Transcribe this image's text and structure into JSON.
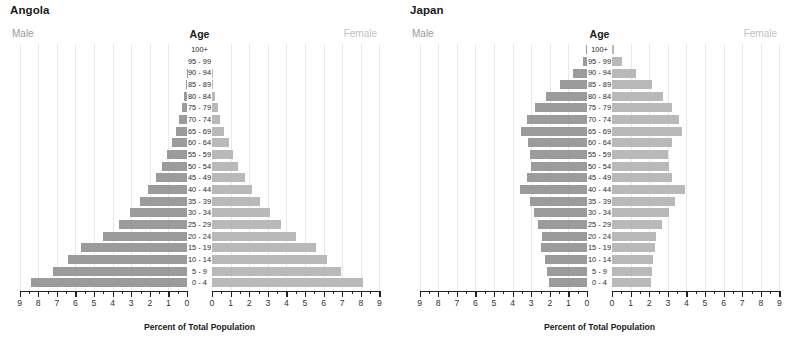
{
  "chart_data": {
    "type": "bar",
    "chart_style": "population-pyramid",
    "xlabel": "Percent of Total Population",
    "ylabel": "Age",
    "xlim": [
      0,
      9
    ],
    "xticks": [
      0,
      1,
      2,
      3,
      4,
      5,
      6,
      7,
      8,
      9
    ],
    "grid": true,
    "legend_position": "top-left-and-top-right",
    "categories": [
      "0 - 4",
      "5 - 9",
      "10 - 14",
      "15 - 19",
      "20 - 24",
      "25 - 29",
      "30 - 34",
      "35 - 39",
      "40 - 44",
      "45 - 49",
      "50 - 54",
      "55 - 59",
      "60 - 64",
      "65 - 69",
      "70 - 74",
      "75 - 79",
      "80 - 84",
      "85 - 89",
      "90 - 94",
      "95 - 99",
      "100+"
    ],
    "panels": [
      {
        "name": "Angola",
        "series": [
          {
            "name": "Male",
            "side": "left",
            "color": "#9b9b9b",
            "values": [
              8.4,
              7.2,
              6.4,
              5.7,
              4.5,
              3.65,
              3.05,
              2.55,
              2.1,
              1.65,
              1.35,
              1.1,
              0.82,
              0.6,
              0.42,
              0.26,
              0.14,
              0.07,
              0.02,
              0.0,
              0.0
            ]
          },
          {
            "name": "Female",
            "side": "right",
            "color": "#b9b9b9",
            "values": [
              8.1,
              6.95,
              6.2,
              5.6,
              4.5,
              3.7,
              3.1,
              2.6,
              2.15,
              1.75,
              1.4,
              1.15,
              0.9,
              0.65,
              0.45,
              0.3,
              0.16,
              0.08,
              0.03,
              0.0,
              0.0
            ]
          }
        ]
      },
      {
        "name": "Japan",
        "series": [
          {
            "name": "Male",
            "side": "left",
            "color": "#9b9b9b",
            "values": [
              2.05,
              2.15,
              2.25,
              2.5,
              2.4,
              2.65,
              2.85,
              3.05,
              3.6,
              3.25,
              3.0,
              3.05,
              3.15,
              3.55,
              3.25,
              2.8,
              2.2,
              1.45,
              0.75,
              0.22,
              0.03
            ]
          },
          {
            "name": "Female",
            "side": "right",
            "color": "#b9b9b9",
            "values": [
              2.1,
              2.15,
              2.2,
              2.3,
              2.35,
              2.7,
              3.05,
              3.4,
              3.95,
              3.25,
              3.05,
              3.0,
              3.2,
              3.75,
              3.6,
              3.2,
              2.75,
              2.15,
              1.3,
              0.55,
              0.1
            ]
          }
        ]
      }
    ]
  },
  "panels": [
    {
      "title": "Angola",
      "male_label": "Male",
      "female_label": "Female",
      "age_label": "Age",
      "axis_title": "Percent of Total Population"
    },
    {
      "title": "Japan",
      "male_label": "Male",
      "female_label": "Female",
      "age_label": "Age",
      "axis_title": "Percent of Total Population"
    }
  ]
}
